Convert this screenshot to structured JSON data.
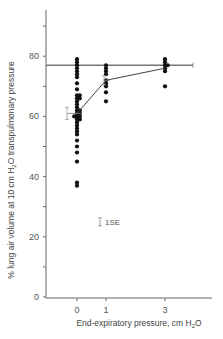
{
  "chart_data": {
    "type": "scatter",
    "title": "",
    "xlabel": "End-expiratory pressure, cm H2O",
    "xlabel_parts": {
      "pre": "End-expiratory pressure, cm H",
      "sub": "2",
      "post": "O"
    },
    "ylabel": "% lung air volume at 10 cm H2O transpulmonary pressure",
    "ylabel_parts": {
      "pre": "% lung air volume at 10 cm H",
      "sub": "2",
      "post": "O transpulmonary pressure"
    },
    "xticks": [
      0,
      1,
      3
    ],
    "yticks": [
      0,
      10,
      20,
      30,
      40,
      50,
      60,
      70,
      80,
      90
    ],
    "ytick_labels": [
      0,
      20,
      40,
      60,
      80
    ],
    "ylim": [
      0,
      95
    ],
    "xlim": [
      -1,
      4.6
    ],
    "grid": false,
    "reference_line": {
      "y": 77,
      "x_from": -1,
      "x_to": 4.5,
      "label": "normal"
    },
    "series": [
      {
        "name": "individual values",
        "points": [
          {
            "x": 0,
            "values": [
              79,
              78,
              77,
              76,
              75,
              74,
              73,
              71,
              69,
              67,
              67,
              66,
              66,
              65,
              64,
              63,
              62,
              62,
              61,
              61,
              60,
              60,
              60,
              59,
              59,
              58,
              57,
              56,
              55,
              54,
              52,
              50,
              48,
              45,
              38,
              37
            ]
          },
          {
            "x": 1,
            "values": [
              77,
              76,
              75,
              74,
              72,
              71,
              70,
              68,
              65
            ]
          },
          {
            "x": 3,
            "values": [
              79,
              78,
              77,
              77,
              76,
              75,
              70
            ]
          }
        ]
      },
      {
        "name": "mean",
        "type": "line",
        "x": [
          0,
          1,
          3
        ],
        "values": [
          61,
          72,
          76
        ],
        "se": [
          2,
          1.5,
          1
        ]
      }
    ],
    "annotations": [
      {
        "text": "1SE",
        "x": 1,
        "y": 25,
        "type": "error-bar-legend"
      }
    ]
  }
}
